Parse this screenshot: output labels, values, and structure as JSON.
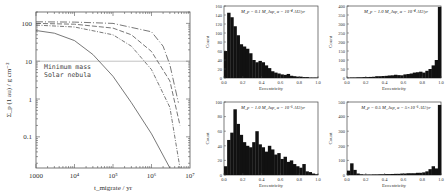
{
  "chart_data": [
    {
      "type": "line",
      "title": "",
      "xlabel": "t_migrate / yr",
      "ylabel": "Σ_p (1 au) / g cm^-2",
      "xscale": "log",
      "yscale": "log",
      "xlim": [
        1000,
        10000000
      ],
      "ylim": [
        0.015,
        200
      ],
      "x_tick_labels": [
        "1000",
        "10⁴",
        "10⁵",
        "10⁶",
        "10⁷"
      ],
      "y_tick_labels": [
        "100",
        "10",
        "1",
        "0.1"
      ],
      "annotation": [
        "Minimum mass",
        "Solar nebula"
      ],
      "reference_line": {
        "y": 10,
        "label": "Minimum mass Solar nebula"
      },
      "series": [
        {
          "name": "solid",
          "style": "solid",
          "x": [
            1000,
            3000,
            10000,
            30000,
            100000,
            300000,
            1000000,
            3000000
          ],
          "y": [
            65,
            55,
            35,
            15,
            4,
            0.8,
            0.12,
            0.015
          ]
        },
        {
          "name": "dash-dot",
          "style": "dashdot",
          "x": [
            1000,
            10000,
            100000,
            300000,
            1000000,
            3000000,
            5500000
          ],
          "y": [
            90,
            80,
            50,
            25,
            6,
            0.6,
            0.015
          ]
        },
        {
          "name": "long-dash",
          "style": "dashed",
          "x": [
            1000,
            10000,
            100000,
            300000,
            1000000,
            3000000,
            5500000
          ],
          "y": [
            100,
            95,
            75,
            50,
            18,
            3,
            0.2
          ]
        },
        {
          "name": "long-dash-dot",
          "style": "longdash",
          "x": [
            1000,
            10000,
            100000,
            1000000,
            2000000,
            3000000,
            5000000
          ],
          "y": [
            110,
            108,
            100,
            60,
            25,
            8,
            0.8
          ]
        }
      ]
    },
    {
      "type": "bar",
      "title": "M_p = 0.1 M_Jup, α = 10^-4 AU/yr",
      "xlabel": "Eccentricity",
      "ylabel": "Count",
      "xlim": [
        0,
        1
      ],
      "ylim": [
        0,
        160
      ],
      "x_tick_labels": [
        "0.0",
        "0.2",
        "0.4",
        "0.6",
        "0.8",
        "1.0"
      ],
      "y_tick_labels": [
        "0",
        "20",
        "40",
        "60",
        "80",
        "100",
        "120",
        "140",
        "160"
      ],
      "categories": [
        0.0,
        0.033,
        0.067,
        0.1,
        0.133,
        0.167,
        0.2,
        0.233,
        0.267,
        0.3,
        0.333,
        0.367,
        0.4,
        0.433,
        0.467,
        0.5,
        0.533,
        0.567,
        0.6,
        0.633,
        0.667,
        0.7,
        0.733,
        0.767,
        0.8,
        0.833,
        0.867,
        0.9,
        0.933,
        0.967
      ],
      "values": [
        60,
        145,
        135,
        115,
        95,
        75,
        70,
        65,
        55,
        40,
        35,
        38,
        35,
        28,
        22,
        15,
        12,
        10,
        8,
        7,
        9,
        5,
        4,
        3,
        3,
        2,
        2,
        1,
        1,
        1
      ]
    },
    {
      "type": "bar",
      "title": "M_p = 1.0 M_Jup, α = 10^-4 AU/yr",
      "xlabel": "Eccentricity",
      "ylabel": "Count",
      "xlim": [
        0,
        1
      ],
      "ylim": [
        0,
        400
      ],
      "x_tick_labels": [
        "0.0",
        "0.2",
        "0.4",
        "0.6",
        "0.8",
        "1.0"
      ],
      "y_tick_labels": [
        "0",
        "50",
        "100",
        "150",
        "200",
        "250",
        "300",
        "350",
        "400"
      ],
      "categories": [
        0.0,
        0.033,
        0.067,
        0.1,
        0.133,
        0.167,
        0.2,
        0.233,
        0.267,
        0.3,
        0.333,
        0.367,
        0.4,
        0.433,
        0.467,
        0.5,
        0.533,
        0.567,
        0.6,
        0.633,
        0.667,
        0.7,
        0.733,
        0.767,
        0.8,
        0.833,
        0.867,
        0.9,
        0.933,
        0.967
      ],
      "values": [
        2,
        3,
        3,
        4,
        4,
        5,
        5,
        6,
        7,
        10,
        10,
        11,
        12,
        14,
        15,
        18,
        16,
        15,
        20,
        22,
        25,
        30,
        32,
        35,
        30,
        40,
        50,
        70,
        100,
        395
      ]
    },
    {
      "type": "bar",
      "title": "M_p = 1.0 M_Jup, α = 10^-5 AU/yr",
      "xlabel": "Eccentricity",
      "ylabel": "Count",
      "xlim": [
        0,
        1
      ],
      "ylim": [
        0,
        100
      ],
      "x_tick_labels": [
        "0.0",
        "0.2",
        "0.4",
        "0.6",
        "0.8",
        "1.0"
      ],
      "y_tick_labels": [
        "0",
        "20",
        "40",
        "60",
        "80",
        "100"
      ],
      "categories": [
        0.0,
        0.033,
        0.067,
        0.1,
        0.133,
        0.167,
        0.2,
        0.233,
        0.267,
        0.3,
        0.333,
        0.367,
        0.4,
        0.433,
        0.467,
        0.5,
        0.533,
        0.567,
        0.6,
        0.633,
        0.667,
        0.7,
        0.733,
        0.767,
        0.8,
        0.833,
        0.867,
        0.9,
        0.933,
        0.967
      ],
      "values": [
        12,
        48,
        58,
        90,
        70,
        55,
        45,
        40,
        38,
        45,
        60,
        42,
        38,
        32,
        40,
        35,
        28,
        30,
        22,
        25,
        18,
        20,
        15,
        12,
        10,
        15,
        5,
        4,
        2,
        1
      ]
    },
    {
      "type": "bar",
      "title": "M_p = 0.5 M_Jup, α = 5 × 10^-5 AU/yr",
      "xlabel": "Eccentricity",
      "ylabel": "Count",
      "xlim": [
        0,
        1
      ],
      "ylim": [
        0,
        500
      ],
      "x_tick_labels": [
        "0.0",
        "0.2",
        "0.4",
        "0.6",
        "0.8",
        "1.0"
      ],
      "y_tick_labels": [
        "0",
        "100",
        "200",
        "300",
        "400",
        "500"
      ],
      "categories": [
        0.0,
        0.033,
        0.067,
        0.1,
        0.133,
        0.167,
        0.2,
        0.233,
        0.267,
        0.3,
        0.333,
        0.367,
        0.4,
        0.433,
        0.467,
        0.5,
        0.533,
        0.567,
        0.6,
        0.633,
        0.667,
        0.7,
        0.733,
        0.767,
        0.8,
        0.833,
        0.867,
        0.9,
        0.933,
        0.967
      ],
      "values": [
        30,
        80,
        35,
        10,
        5,
        3,
        3,
        3,
        4,
        4,
        5,
        5,
        6,
        6,
        7,
        8,
        8,
        10,
        10,
        12,
        12,
        12,
        15,
        15,
        18,
        25,
        40,
        60,
        45,
        480
      ]
    }
  ],
  "left_plot": {
    "ylabel": "Σ_p (1 au) / g cm⁻²",
    "xlabel": "t_migrate / yr",
    "annotation_line1": "Minimum mass",
    "annotation_line2": "Solar nebula",
    "y_ticks": [
      "100",
      "10",
      "1",
      "0.1"
    ],
    "x_ticks": [
      "1000",
      "10⁴",
      "10⁵",
      "10⁶",
      "10⁷"
    ]
  },
  "histograms": [
    {
      "title": "M_p = 0.1 M_Jup, α = 10⁻⁴ AU/yr",
      "ylabel": "Count",
      "xlabel": "Eccentricity"
    },
    {
      "title": "M_p = 1.0 M_Jup, α = 10⁻⁴ AU/yr",
      "ylabel": "Count",
      "xlabel": "Eccentricity"
    },
    {
      "title": "M_p = 1.0 M_Jup, α = 10⁻⁵ AU/yr",
      "ylabel": "Count",
      "xlabel": "Eccentricity"
    },
    {
      "title": "M_p = 0.5 M_Jup, α = 5×10⁻⁵ AU/yr",
      "ylabel": "Count",
      "xlabel": "Eccentricity"
    }
  ]
}
